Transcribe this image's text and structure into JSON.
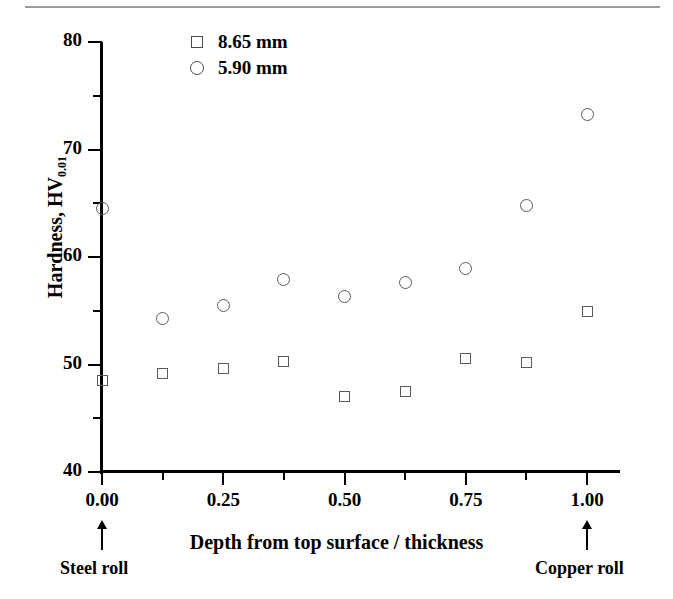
{
  "chart_data": {
    "type": "scatter",
    "title": "",
    "xlabel": "Depth from top surface / thickness",
    "ylabel": "Hardness, HV",
    "ylabel_sub": "0.01",
    "xlim": [
      0.0,
      1.0
    ],
    "ylim": [
      40,
      80
    ],
    "grid": false,
    "legend_position": "top-left-inside",
    "x_ticks": [
      "0.00",
      "0.25",
      "0.50",
      "0.75",
      "1.00"
    ],
    "x_tick_values": [
      0.0,
      0.25,
      0.5,
      0.75,
      1.0
    ],
    "x_minor_tick_values": [
      0.125,
      0.375,
      0.625,
      0.875
    ],
    "y_ticks": [
      "40",
      "50",
      "60",
      "70",
      "80"
    ],
    "y_tick_values": [
      40,
      50,
      60,
      70,
      80
    ],
    "y_minor_tick_values": [
      45,
      55,
      65,
      75
    ],
    "x": [
      0.0,
      0.125,
      0.25,
      0.375,
      0.5,
      0.625,
      0.75,
      0.875,
      1.0
    ],
    "series": [
      {
        "name": "8.65 mm",
        "marker": "open-square",
        "values": [
          48.5,
          49.2,
          49.6,
          50.3,
          47.0,
          47.5,
          50.6,
          50.2,
          54.9
        ]
      },
      {
        "name": "5.90 mm",
        "marker": "open-circle",
        "values": [
          64.5,
          54.3,
          55.5,
          57.9,
          56.3,
          57.6,
          58.9,
          64.8,
          73.3
        ]
      }
    ],
    "annotations": [
      {
        "text": "Steel roll",
        "x": 0.0,
        "arrow": "up"
      },
      {
        "text": "Copper roll",
        "x": 1.0,
        "arrow": "up"
      }
    ],
    "colors": {
      "marker_stroke": "#59595f",
      "axis": "#000000",
      "background": "#ffffff",
      "top_rule": "#9b9b9b"
    }
  },
  "legend": {
    "items": [
      {
        "label": "8.65 mm",
        "marker": "square-marker-icon"
      },
      {
        "label": "5.90 mm",
        "marker": "circle-marker-icon"
      }
    ]
  },
  "axes": {
    "y_title_main": "Hardness, HV",
    "y_title_sub": "0.01",
    "x_title": "Depth from top surface / thickness"
  },
  "annotations": {
    "left": "Steel roll",
    "right": "Copper roll"
  }
}
